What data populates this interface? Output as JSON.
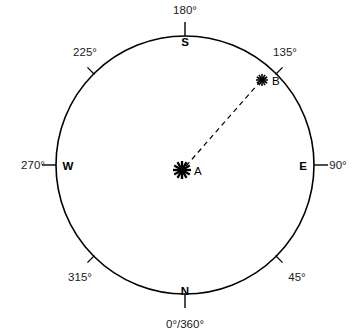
{
  "figure": {
    "kind": "compass-azimuth-diagram",
    "background_color": "#ffffff",
    "stroke_color": "#000000",
    "text_color": "#1a1a1a"
  },
  "circle": {
    "center_x": 185,
    "center_y": 165,
    "radius": 129,
    "stroke_width": 1.6
  },
  "degree_labels": [
    {
      "text": "180°",
      "bearing": 180,
      "x": 185,
      "y": 14,
      "anchor": "middle"
    },
    {
      "text": "135°",
      "bearing": 135,
      "x": 285,
      "y": 56,
      "anchor": "middle"
    },
    {
      "text": "90°",
      "bearing": 90,
      "x": 338,
      "y": 169,
      "anchor": "middle"
    },
    {
      "text": "45°",
      "bearing": 45,
      "x": 297,
      "y": 281,
      "anchor": "middle"
    },
    {
      "text": "0°/360°",
      "bearing": 0,
      "x": 185,
      "y": 328,
      "anchor": "middle"
    },
    {
      "text": "315°",
      "bearing": 315,
      "x": 80,
      "y": 281,
      "anchor": "middle"
    },
    {
      "text": "270°",
      "bearing": 270,
      "x": 33,
      "y": 169,
      "anchor": "middle"
    },
    {
      "text": "225°",
      "bearing": 225,
      "x": 85,
      "y": 56,
      "anchor": "middle"
    }
  ],
  "cardinal_labels": [
    {
      "text": "S",
      "bearing": 180,
      "x": 185,
      "y": 46
    },
    {
      "text": "E",
      "bearing": 90,
      "x": 303,
      "y": 170
    },
    {
      "text": "N",
      "bearing": 0,
      "x": 185,
      "y": 295
    },
    {
      "text": "W",
      "bearing": 270,
      "x": 68,
      "y": 170
    }
  ],
  "ticks": {
    "cardinal_length": 14,
    "diagonal_length": 9,
    "cardinal_bearings": [
      0,
      90,
      180,
      270
    ],
    "diagonal_bearings": [
      45,
      135,
      225,
      315
    ]
  },
  "points": [
    {
      "id": "A",
      "label": "A",
      "marker": "starburst",
      "x": 182,
      "y": 170,
      "size": 9,
      "label_x": 194,
      "label_y": 175
    },
    {
      "id": "B",
      "label": "B",
      "marker": "starburst",
      "x": 262,
      "y": 80,
      "size": 6,
      "label_x": 272,
      "label_y": 85
    }
  ],
  "connector": {
    "from": "A",
    "to": "B",
    "style": "dashed",
    "dash_pattern": "5 4",
    "stroke_width": 1.2,
    "x1": 186,
    "y1": 166,
    "x2": 259,
    "y2": 83
  }
}
